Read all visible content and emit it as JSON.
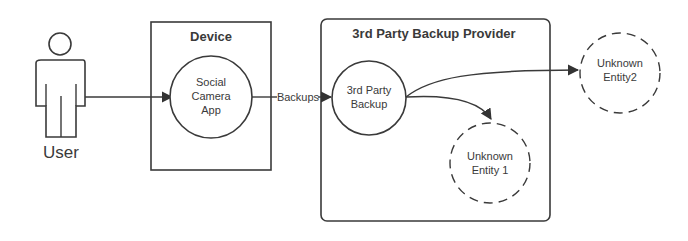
{
  "diagram": {
    "title": "",
    "actors": [
      {
        "id": "user",
        "label": "User"
      }
    ],
    "boundaries": [
      {
        "id": "device",
        "label": "Device"
      },
      {
        "id": "provider",
        "label": "3rd Party Backup Provider"
      }
    ],
    "processes": [
      {
        "id": "social-camera-app",
        "lines": [
          "Social",
          "Camera",
          "App"
        ]
      },
      {
        "id": "third-party-backup",
        "lines": [
          "3rd Party",
          "Backup"
        ]
      }
    ],
    "external_entities": [
      {
        "id": "unknown-entity-1",
        "lines": [
          "Unknown",
          "Entity 1"
        ],
        "style": "dashed"
      },
      {
        "id": "unknown-entity-2",
        "lines": [
          "Unknown",
          "Entity2"
        ],
        "style": "dashed"
      }
    ],
    "flows": [
      {
        "from": "user",
        "to": "social-camera-app",
        "label": ""
      },
      {
        "from": "social-camera-app",
        "to": "third-party-backup",
        "label": "Backups"
      },
      {
        "from": "third-party-backup",
        "to": "unknown-entity-1",
        "label": ""
      },
      {
        "from": "third-party-backup",
        "to": "unknown-entity-2",
        "label": ""
      }
    ],
    "colors": {
      "stroke": "#3a3a3a",
      "text": "#3a3a3a",
      "background": "#ffffff"
    }
  }
}
